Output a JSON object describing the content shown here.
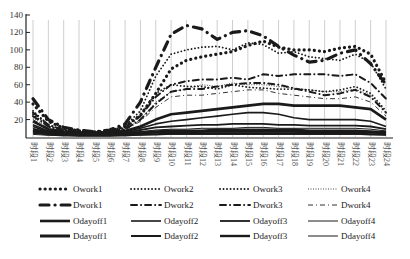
{
  "chart_data": {
    "type": "line",
    "title": "",
    "xlabel": "",
    "ylabel": "",
    "ylim": [
      0,
      140
    ],
    "yticks": [
      20,
      40,
      60,
      80,
      100,
      120,
      140
    ],
    "grid": "vertical lines at each category",
    "legend_position": "bottom",
    "categories": [
      "时段1",
      "时段2",
      "时段3",
      "时段4",
      "时段5",
      "时段6",
      "时段7",
      "时段8",
      "时段9",
      "时段10",
      "时段11",
      "时段12",
      "时段13",
      "时段14",
      "时段15",
      "时段16",
      "时段17",
      "时段18",
      "时段19",
      "时段20",
      "时段21",
      "时段22",
      "时段23",
      "时段24"
    ],
    "series": [
      {
        "name": "Owork1",
        "style": "bigdot",
        "width": 2.6,
        "values": [
          38,
          18,
          10,
          7,
          6,
          7,
          12,
          25,
          50,
          78,
          88,
          92,
          95,
          98,
          105,
          110,
          103,
          100,
          100,
          98,
          102,
          104,
          95,
          62
        ]
      },
      {
        "name": "Owork2",
        "style": "dot",
        "width": 1.6,
        "values": [
          30,
          14,
          8,
          6,
          5,
          7,
          13,
          30,
          70,
          95,
          100,
          103,
          104,
          100,
          108,
          106,
          96,
          98,
          92,
          90,
          88,
          95,
          85,
          55
        ]
      },
      {
        "name": "Owork3",
        "style": "dot",
        "width": 1.6,
        "values": [
          26,
          12,
          7,
          5,
          5,
          6,
          10,
          25,
          50,
          60,
          58,
          58,
          55,
          60,
          57,
          56,
          55,
          55,
          54,
          52,
          54,
          58,
          50,
          30
        ]
      },
      {
        "name": "Owork4",
        "style": "fine",
        "width": 1,
        "values": [
          22,
          10,
          6,
          5,
          5,
          6,
          9,
          20,
          40,
          52,
          55,
          60,
          58,
          62,
          60,
          60,
          58,
          56,
          54,
          52,
          52,
          55,
          48,
          28
        ]
      },
      {
        "name": "Dwork1",
        "style": "longdash",
        "width": 3,
        "values": [
          44,
          20,
          11,
          8,
          6,
          8,
          15,
          40,
          80,
          118,
          128,
          124,
          112,
          120,
          122,
          116,
          104,
          94,
          86,
          88,
          96,
          100,
          84,
          60
        ]
      },
      {
        "name": "Dwork2",
        "style": "dashdot",
        "width": 2,
        "values": [
          28,
          14,
          8,
          6,
          5,
          6,
          11,
          24,
          46,
          60,
          64,
          66,
          66,
          68,
          66,
          72,
          70,
          72,
          72,
          72,
          70,
          72,
          62,
          44
        ]
      },
      {
        "name": "Dwork3",
        "style": "dashdot",
        "width": 2,
        "values": [
          24,
          12,
          7,
          5,
          5,
          5,
          9,
          20,
          38,
          52,
          55,
          55,
          58,
          60,
          62,
          62,
          60,
          56,
          52,
          48,
          50,
          54,
          46,
          28
        ]
      },
      {
        "name": "Dwork4",
        "style": "thindashdot",
        "width": 1,
        "values": [
          20,
          10,
          6,
          5,
          5,
          5,
          8,
          18,
          34,
          46,
          48,
          48,
          50,
          52,
          54,
          54,
          50,
          48,
          46,
          44,
          44,
          46,
          40,
          24
        ]
      },
      {
        "name": "Odayoff1",
        "style": "solid",
        "width": 2.6,
        "values": [
          18,
          9,
          6,
          5,
          5,
          5,
          7,
          12,
          20,
          26,
          28,
          30,
          32,
          34,
          36,
          38,
          38,
          36,
          36,
          36,
          36,
          34,
          32,
          20
        ]
      },
      {
        "name": "Odayoff2",
        "style": "solid",
        "width": 1.6,
        "values": [
          14,
          7,
          5,
          4,
          4,
          4,
          6,
          10,
          15,
          18,
          20,
          22,
          24,
          26,
          28,
          28,
          26,
          22,
          20,
          20,
          20,
          20,
          18,
          12
        ]
      },
      {
        "name": "Odayoff3",
        "style": "solid",
        "width": 1.8,
        "values": [
          12,
          6,
          4,
          4,
          4,
          4,
          5,
          8,
          11,
          12,
          13,
          14,
          14,
          15,
          15,
          15,
          14,
          14,
          13,
          13,
          13,
          13,
          12,
          9
        ]
      },
      {
        "name": "Odayoff4",
        "style": "solid",
        "width": 1,
        "values": [
          10,
          5,
          4,
          3,
          3,
          3,
          4,
          6,
          8,
          9,
          9,
          10,
          10,
          10,
          11,
          11,
          10,
          10,
          10,
          10,
          10,
          10,
          9,
          7
        ]
      },
      {
        "name": "Dayoff1",
        "legend": "Ddayoff1",
        "style": "solid",
        "width": 3,
        "values": [
          8,
          5,
          3,
          3,
          3,
          3,
          4,
          5,
          6,
          7,
          7,
          7,
          8,
          8,
          8,
          8,
          8,
          8,
          7,
          7,
          7,
          7,
          6,
          5
        ]
      },
      {
        "name": "Ddayoff2",
        "style": "solid",
        "width": 2,
        "values": [
          6,
          4,
          3,
          2,
          2,
          2,
          3,
          4,
          5,
          5,
          5,
          6,
          6,
          6,
          6,
          6,
          6,
          6,
          5,
          5,
          5,
          5,
          5,
          4
        ]
      },
      {
        "name": "Ddayoff3",
        "style": "solid",
        "width": 2.4,
        "values": [
          5,
          3,
          2,
          2,
          2,
          2,
          2,
          3,
          3,
          4,
          4,
          4,
          4,
          4,
          4,
          4,
          4,
          4,
          4,
          4,
          4,
          4,
          3,
          3
        ]
      },
      {
        "name": "Ddayoff4",
        "style": "solid",
        "width": 1,
        "values": [
          3,
          2,
          2,
          1,
          1,
          1,
          2,
          2,
          3,
          3,
          3,
          3,
          3,
          3,
          3,
          3,
          3,
          3,
          3,
          3,
          3,
          3,
          3,
          2
        ]
      }
    ]
  },
  "legend": {
    "rows": [
      [
        "Owork1",
        "Owork2",
        "Owork3",
        "Owork4"
      ],
      [
        "Dwork1",
        "Dwork2",
        "Dwork3",
        "Dwork4"
      ],
      [
        "Odayoff1",
        "Odayoff2",
        "Odayoff3",
        "Odayoff4"
      ],
      [
        "Ddayoff1",
        "Ddayoff2",
        "Ddayoff3",
        "Ddayoff4"
      ]
    ]
  }
}
